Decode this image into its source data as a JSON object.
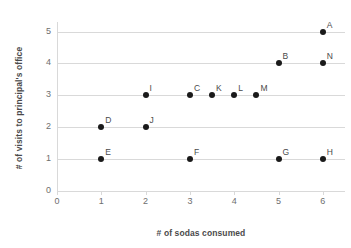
{
  "chart_data": {
    "type": "scatter",
    "title": "",
    "xlabel": "# of sodas consumed",
    "ylabel": "# of visits to principal's office",
    "xlim": [
      0,
      6.5
    ],
    "ylim": [
      0,
      5.3
    ],
    "x_ticks": [
      "0",
      "1",
      "2",
      "3",
      "4",
      "5",
      "6"
    ],
    "x_tick_values": [
      0,
      1,
      2,
      3,
      4,
      5,
      6
    ],
    "y_ticks": [
      "0",
      "1",
      "2",
      "3",
      "4",
      "5"
    ],
    "y_tick_values": [
      0,
      1,
      2,
      3,
      4,
      5
    ],
    "grid": "horizontal",
    "legend": "none",
    "marker_color": "#1a1a1a",
    "gridline_color": "#d9d9d9",
    "background_color": "#ffffff",
    "points": [
      {
        "label": "A",
        "x": 6,
        "y": 5
      },
      {
        "label": "B",
        "x": 5,
        "y": 4
      },
      {
        "label": "N",
        "x": 6,
        "y": 4
      },
      {
        "label": "I",
        "x": 2,
        "y": 3
      },
      {
        "label": "C",
        "x": 3,
        "y": 3
      },
      {
        "label": "K",
        "x": 3.5,
        "y": 3
      },
      {
        "label": "L",
        "x": 4,
        "y": 3
      },
      {
        "label": "M",
        "x": 4.5,
        "y": 3
      },
      {
        "label": "D",
        "x": 1,
        "y": 2
      },
      {
        "label": "J",
        "x": 2,
        "y": 2
      },
      {
        "label": "E",
        "x": 1,
        "y": 1
      },
      {
        "label": "F",
        "x": 3,
        "y": 1
      },
      {
        "label": "G",
        "x": 5,
        "y": 1
      },
      {
        "label": "H",
        "x": 6,
        "y": 1
      }
    ]
  }
}
